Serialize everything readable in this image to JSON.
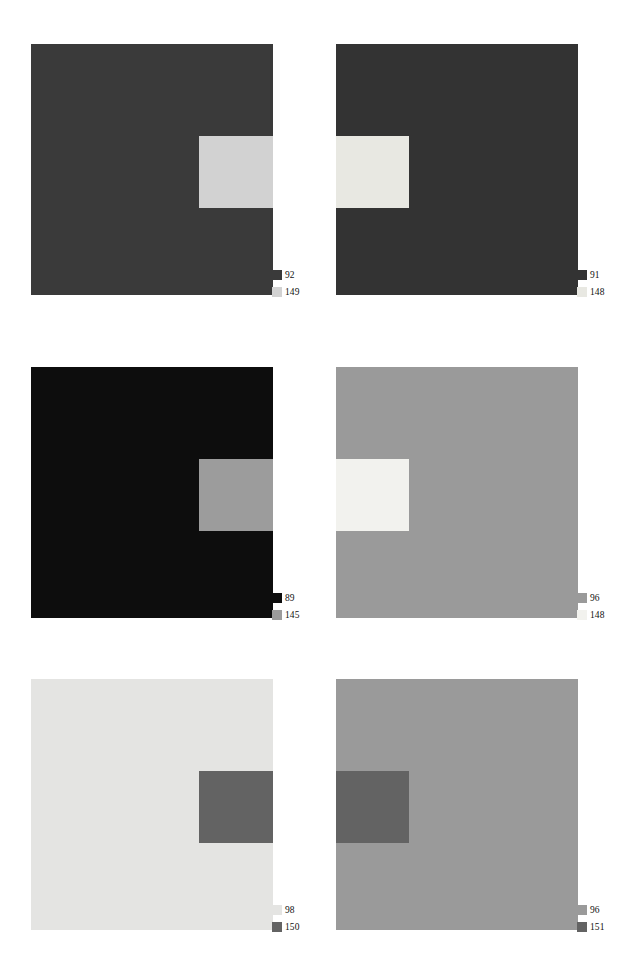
{
  "figure": {
    "type": "image-panel-grid",
    "columns": 2,
    "rows": 3,
    "background": "#ffffff",
    "panels": [
      {
        "id": "panel-1",
        "position": "top-left",
        "x": 31,
        "y": 44,
        "width": 242,
        "height": 251,
        "surround": {
          "value": "92",
          "color": "#3a3a3a"
        },
        "inset": {
          "value": "149",
          "color": "#d2d2d2",
          "x": 168,
          "y": 92,
          "width": 74,
          "height": 72,
          "side": "right"
        },
        "legend": {
          "x": 241,
          "y": 222,
          "entries": [
            {
              "swatch_color": "#3a3a3a",
              "value": "92"
            },
            {
              "swatch_color": "#d2d2d2",
              "value": "149"
            }
          ]
        }
      },
      {
        "id": "panel-2",
        "position": "top-right",
        "x": 336,
        "y": 44,
        "width": 242,
        "height": 251,
        "surround": {
          "value": "91",
          "color": "#333333"
        },
        "inset": {
          "value": "148",
          "color": "#e8e8e2",
          "x": 0,
          "y": 92,
          "width": 73,
          "height": 72,
          "side": "left"
        },
        "legend": {
          "x": 241,
          "y": 222,
          "entries": [
            {
              "swatch_color": "#333333",
              "value": "91"
            },
            {
              "swatch_color": "#e8e8e2",
              "value": "148"
            }
          ]
        }
      },
      {
        "id": "panel-3",
        "position": "middle-left",
        "x": 31,
        "y": 367,
        "width": 242,
        "height": 251,
        "surround": {
          "value": "89",
          "color": "#0d0d0d"
        },
        "inset": {
          "value": "145",
          "color": "#9c9c9c",
          "x": 168,
          "y": 92,
          "width": 74,
          "height": 72,
          "side": "right"
        },
        "legend": {
          "x": 241,
          "y": 222,
          "entries": [
            {
              "swatch_color": "#0d0d0d",
              "value": "89"
            },
            {
              "swatch_color": "#9c9c9c",
              "value": "145"
            }
          ]
        }
      },
      {
        "id": "panel-4",
        "position": "middle-right",
        "x": 336,
        "y": 367,
        "width": 242,
        "height": 251,
        "surround": {
          "value": "96",
          "color": "#9a9a9a"
        },
        "inset": {
          "value": "148",
          "color": "#f2f2ee",
          "x": 0,
          "y": 92,
          "width": 73,
          "height": 72,
          "side": "left"
        },
        "legend": {
          "x": 241,
          "y": 222,
          "entries": [
            {
              "swatch_color": "#9a9a9a",
              "value": "96"
            },
            {
              "swatch_color": "#f2f2ee",
              "value": "148"
            }
          ]
        }
      },
      {
        "id": "panel-5",
        "position": "bottom-left",
        "x": 31,
        "y": 679,
        "width": 242,
        "height": 251,
        "surround": {
          "value": "98",
          "color": "#e4e4e2"
        },
        "inset": {
          "value": "150",
          "color": "#636363",
          "x": 168,
          "y": 92,
          "width": 74,
          "height": 72,
          "side": "right"
        },
        "legend": {
          "x": 241,
          "y": 222,
          "entries": [
            {
              "swatch_color": "#e4e4e2",
              "value": "98"
            },
            {
              "swatch_color": "#636363",
              "value": "150"
            }
          ]
        }
      },
      {
        "id": "panel-6",
        "position": "bottom-right",
        "x": 336,
        "y": 679,
        "width": 242,
        "height": 251,
        "surround": {
          "value": "96",
          "color": "#9a9a9a"
        },
        "inset": {
          "value": "151",
          "color": "#636363",
          "x": 0,
          "y": 92,
          "width": 73,
          "height": 72,
          "side": "left"
        },
        "legend": {
          "x": 241,
          "y": 222,
          "entries": [
            {
              "swatch_color": "#9a9a9a",
              "value": "96"
            },
            {
              "swatch_color": "#636363",
              "value": "151"
            }
          ]
        }
      }
    ]
  }
}
